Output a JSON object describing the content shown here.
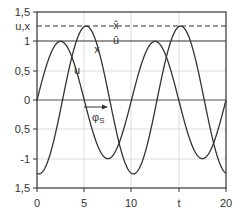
{
  "chart_data": {
    "type": "line",
    "title": "",
    "xlabel": "t",
    "ylabel": "u,x",
    "xlim": [
      0,
      20
    ],
    "ylim": [
      -1.5,
      1.5
    ],
    "grid": true,
    "x_ticks": [
      "0",
      "5",
      "10",
      "t",
      "20"
    ],
    "y_ticks": [
      "1,5",
      "u,x",
      "1",
      "0,5",
      "0",
      "0,5",
      "-1",
      "1,5"
    ],
    "series": [
      {
        "name": "u",
        "formula": "u = sin(2*pi*t/10)",
        "amplitude": 1.0,
        "period": 10,
        "peak_t": 2.5
      },
      {
        "name": "x",
        "formula": "x = -1.26*cos(2*pi*(t-0.2)/10)",
        "amplitude": 1.26,
        "period": 10,
        "peak_t": 5.2
      }
    ],
    "reference_lines": [
      {
        "name": "x-hat",
        "value": 1.26,
        "style": "dashed",
        "label": "x̂"
      },
      {
        "name": "u-hat",
        "value": 1.0,
        "style": "solid",
        "label": "û"
      }
    ],
    "annotations": [
      {
        "text": "x",
        "t": 6.3,
        "y": 0.85
      },
      {
        "text": "u",
        "t": 4.1,
        "y": 0.5
      },
      {
        "text": "φS",
        "t": 6.4,
        "y": -0.28,
        "arrow_from_t": 5.0,
        "arrow_to_t": 7.5
      }
    ],
    "legend": "none"
  },
  "labels": {
    "ux_axis": "u,x",
    "t_axis": "t",
    "xhat": "x̂",
    "uhat": "û",
    "x_curve": "x",
    "u_curve": "u",
    "phase": "φ",
    "phase_sub": "S",
    "y_ticks": [
      "1,5",
      "1",
      "0,5",
      "0",
      "0,5",
      "-1",
      "1,5"
    ],
    "x_ticks": [
      "0",
      "5",
      "10",
      "20"
    ]
  },
  "colors": {
    "line": "#333333",
    "grid": "#d0d0d0",
    "frame": "#333333"
  }
}
